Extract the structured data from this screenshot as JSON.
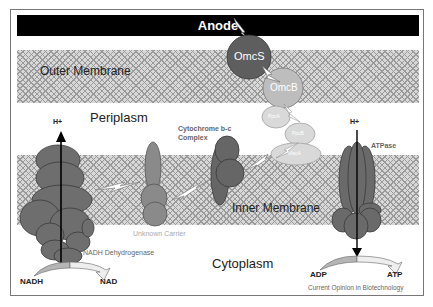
{
  "diagram": {
    "anode_label": "Anode",
    "regions": {
      "outer_membrane": "Outer Membrane",
      "periplasm": "Periplasm",
      "inner_membrane": "Inner Membrane",
      "cytoplasm": "Cytoplasm"
    },
    "proteins": {
      "omcs": "OmcS",
      "omcb": "OmcB",
      "ppca": "PpcA",
      "ppcb": "PpcB",
      "maca": "MacA",
      "cytochrome_bc": "Cytochrome b-c",
      "cytochrome_bc_line2": "Complex",
      "unknown_carrier": "Unknown Carrier",
      "nadh_dehydrogenase": "NADH Dehydrogenase",
      "atpase": "ATPase"
    },
    "substrates": {
      "nadh": "NADH",
      "nad": "NAD",
      "adp": "ADP",
      "atp": "ATP",
      "h_plus_left": "H+",
      "h_plus_right": "H+"
    },
    "credit": "Current Opinion in Biotechnology",
    "colors": {
      "dark_protein": "#6e6e6e",
      "omcs": "#5e5e5e",
      "omcb": "#bdbdbd",
      "light_ellipse": "#d9d9d9",
      "anode": "#000000"
    }
  }
}
